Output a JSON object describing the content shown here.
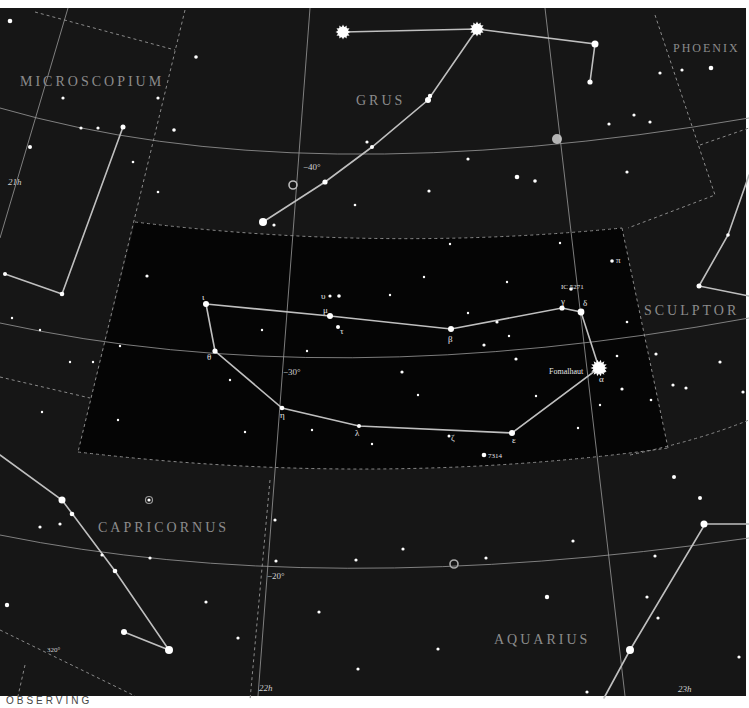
{
  "map": {
    "title": "Piscis Austrinus star chart",
    "colors": {
      "sky_outer": "#161616",
      "sky_focus": "#050505",
      "grid_line": "#9a9a9a",
      "boundary": "#8a8a8a",
      "constellation_line": "#bfbfbf",
      "star": "#ffffff",
      "label": "#8c8c8c",
      "page_bg": "#ffffff"
    },
    "constellations": [
      {
        "name": "MICROSCOPIUM"
      },
      {
        "name": "GRUS"
      },
      {
        "name": "PHOENIX"
      },
      {
        "name": "SCULPTOR"
      },
      {
        "name": "CAPRICORNUS"
      },
      {
        "name": "AQUARIUS"
      }
    ],
    "grid_labels": {
      "dec_minus40": "−40°",
      "dec_minus30": "−30°",
      "dec_minus20": "−20°",
      "ra_21h": "21h",
      "ra_22h": "22h",
      "ra_23h": "23h",
      "ecliptic_320": "320°"
    },
    "focus_stars": [
      {
        "greek": "ι",
        "name": "iota"
      },
      {
        "greek": "θ",
        "name": "theta"
      },
      {
        "greek": "μ",
        "name": "mu"
      },
      {
        "greek": "υ",
        "name": "upsilon"
      },
      {
        "greek": "τ",
        "name": "tau"
      },
      {
        "greek": "β",
        "name": "beta"
      },
      {
        "greek": "γ",
        "name": "gamma"
      },
      {
        "greek": "δ",
        "name": "delta"
      },
      {
        "greek": "α",
        "name": "alpha"
      },
      {
        "greek": "ε",
        "name": "epsilon"
      },
      {
        "greek": "ζ",
        "name": "zeta"
      },
      {
        "greek": "η",
        "name": "eta"
      },
      {
        "greek": "λ",
        "name": "lambda"
      },
      {
        "greek": "π",
        "name": "pi"
      }
    ],
    "named_objects": {
      "fomalhaut": "Fomalhaut",
      "ic5271": "IC 5271",
      "ngc7314": "7314"
    },
    "footer": "OBSERVING"
  }
}
